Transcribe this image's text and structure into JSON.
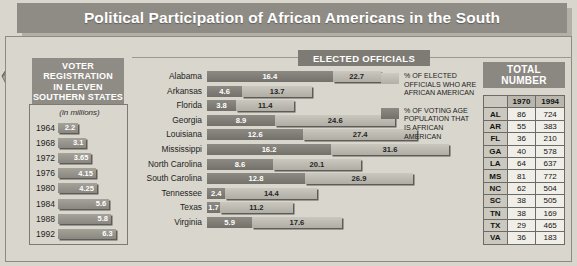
{
  "banner": {
    "title": "Political Participation of African Americans in the South"
  },
  "map": {
    "name": "south-us-map",
    "states": [
      "TX",
      "LA",
      "AR",
      "MS",
      "AL",
      "TN",
      "GA",
      "FL",
      "SC",
      "NC",
      "VA"
    ]
  },
  "voter_registration": {
    "heading_lines": [
      "VOTER",
      "REGISTRATION",
      "IN ELEVEN",
      "SOUTHERN STATES"
    ],
    "units": "(in millions)",
    "max": 7.0,
    "rows": [
      {
        "year": "1964",
        "value": 2.2,
        "display": "2.2"
      },
      {
        "year": "1968",
        "value": 3.1,
        "display": "3.1"
      },
      {
        "year": "1972",
        "value": 3.65,
        "display": "3.65"
      },
      {
        "year": "1976",
        "value": 4.15,
        "display": "4.15"
      },
      {
        "year": "1980",
        "value": 4.25,
        "display": "4.25"
      },
      {
        "year": "1984",
        "value": 5.6,
        "display": "5.6"
      },
      {
        "year": "1988",
        "value": 5.8,
        "display": "5.8"
      },
      {
        "year": "1992",
        "value": 6.3,
        "display": "6.3"
      }
    ]
  },
  "elected_officials": {
    "section_title": "ELECTED OFFICIALS",
    "legend": [
      {
        "swatch": "light",
        "text": "% OF ELECTED OFFICIALS WHO ARE AFRICAN AMERICAN"
      },
      {
        "swatch": "dark",
        "text": "% OF VOTING AGE POPULATION THAT IS AFRICAN AMERICAN"
      }
    ]
  },
  "chart_data": {
    "type": "bar",
    "title": "ELECTED OFFICIALS",
    "orientation": "horizontal",
    "stacked": false,
    "xlabel": "",
    "ylabel": "",
    "xlim": [
      0,
      32
    ],
    "grid": false,
    "legend_position": "right",
    "categories": [
      "Alabama",
      "Arkansas",
      "Florida",
      "Georgia",
      "Louisiana",
      "Mississippi",
      "North Carolina",
      "South Carolina",
      "Tennessee",
      "Texas",
      "Virginia"
    ],
    "series": [
      {
        "name": "% OF ELECTED OFFICIALS WHO ARE AFRICAN AMERICAN",
        "color": "#bfbcb4",
        "values": [
          16.4,
          4.6,
          3.8,
          8.9,
          12.6,
          16.2,
          8.6,
          12.8,
          2.4,
          1.7,
          5.9
        ]
      },
      {
        "name": "% OF VOTING AGE POPULATION THAT IS AFRICAN AMERICAN",
        "color": "#7f7c76",
        "values": [
          22.7,
          13.7,
          11.4,
          24.6,
          27.4,
          31.6,
          20.1,
          26.9,
          14.4,
          11.2,
          17.6
        ]
      }
    ]
  },
  "total_number": {
    "heading_lines": [
      "TOTAL",
      "NUMBER"
    ],
    "columns": [
      "",
      "1970",
      "1994"
    ],
    "rows": [
      {
        "abbr": "AL",
        "y1970": "86",
        "y1994": "724"
      },
      {
        "abbr": "AR",
        "y1970": "55",
        "y1994": "383"
      },
      {
        "abbr": "FL",
        "y1970": "36",
        "y1994": "210"
      },
      {
        "abbr": "GA",
        "y1970": "40",
        "y1994": "578"
      },
      {
        "abbr": "LA",
        "y1970": "64",
        "y1994": "637"
      },
      {
        "abbr": "MS",
        "y1970": "81",
        "y1994": "772"
      },
      {
        "abbr": "NC",
        "y1970": "62",
        "y1994": "504"
      },
      {
        "abbr": "SC",
        "y1970": "38",
        "y1994": "505"
      },
      {
        "abbr": "TN",
        "y1970": "38",
        "y1994": "169"
      },
      {
        "abbr": "TX",
        "y1970": "29",
        "y1994": "465"
      },
      {
        "abbr": "VA",
        "y1970": "36",
        "y1994": "183"
      }
    ]
  }
}
